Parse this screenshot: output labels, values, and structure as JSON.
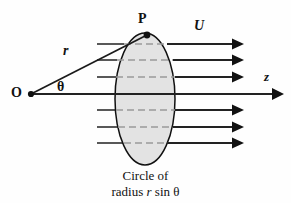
{
  "figure": {
    "labels": {
      "point_P": "P",
      "velocity_U": "U",
      "axis_z": "z",
      "origin_O": "O",
      "radius_r": "r",
      "angle_theta": "θ"
    },
    "caption": {
      "line1": "Circle of",
      "line2_prefix": "radius",
      "line2_radius_symbol": "r",
      "line2_suffix": "sin θ"
    },
    "colors": {
      "stroke": "#111111",
      "ellipse_fill": "#e3e3e3",
      "ellipse_stroke": "#111111",
      "dash_gray": "#9a9a9a",
      "flow_line": "#3a3a3a",
      "background": "#fefefe"
    },
    "geometry": {
      "ellipse_center_x": 145,
      "ellipse_center_y": 99,
      "ellipse_rx": 30,
      "ellipse_ry": 66,
      "origin_x": 31,
      "origin_y": 94,
      "point_p_x": 147,
      "point_p_y": 35,
      "axis_end_x": 283,
      "flow_line_start_x": 97,
      "flow_arrow_end_x": 243,
      "flow_rows_y": [
        44,
        60,
        77,
        110,
        127,
        143
      ]
    }
  }
}
